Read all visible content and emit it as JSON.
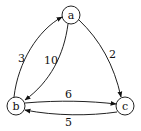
{
  "diagram": {
    "type": "directed-weighted-graph",
    "nodes": [
      {
        "id": "a",
        "label": "a",
        "x": 71,
        "y": 15
      },
      {
        "id": "b",
        "label": "b",
        "x": 16,
        "y": 106
      },
      {
        "id": "c",
        "label": "c",
        "x": 125,
        "y": 106
      }
    ],
    "edges": [
      {
        "from": "b",
        "to": "a",
        "weight": "3"
      },
      {
        "from": "a",
        "to": "b",
        "weight": "10"
      },
      {
        "from": "a",
        "to": "c",
        "weight": "2"
      },
      {
        "from": "b",
        "to": "c",
        "weight": "6"
      },
      {
        "from": "c",
        "to": "b",
        "weight": "5"
      }
    ]
  }
}
